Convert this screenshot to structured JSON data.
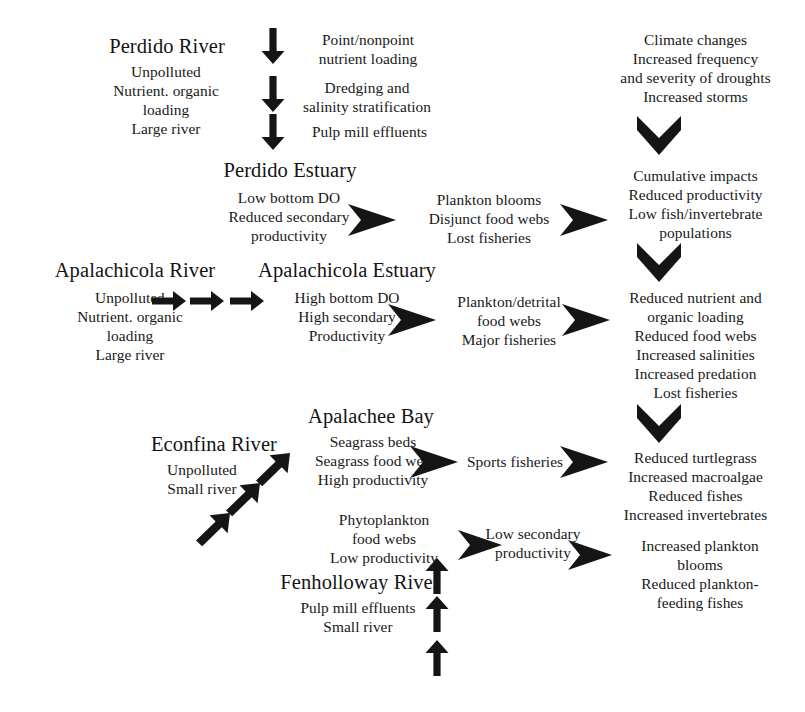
{
  "diagram": {
    "background_color": "#ffffff",
    "ink_color": "#181818",
    "nodes": {
      "perdido_river_heading": "Perdido River",
      "perdido_river_body": "Unpolluted\nNutrient. organic\nloading\nLarge river",
      "perdido_stressors_1": "Point/nonpoint\nnutrient loading",
      "perdido_stressors_2": "Dredging and\nsalinity stratification",
      "perdido_stressors_3": "Pulp mill effluents",
      "perdido_estuary_heading": "Perdido Estuary",
      "perdido_estuary_body": "Low bottom DO\nReduced secondary\nproductivity",
      "perdido_effects": "Plankton blooms\nDisjunct food webs\nLost fisheries",
      "climate": "Climate changes\nIncreased frequency\nand severity of droughts\nIncreased storms",
      "cumulative": "Cumulative impacts\nReduced productivity\nLow fish/invertebrate\npopulations",
      "apalachicola_river_heading": "Apalachicola River",
      "apalachicola_river_body": "Unpolluted\nNutrient. organic\nloading\nLarge river",
      "apalachicola_estuary_heading": "Apalachicola Estuary",
      "apalachicola_estuary_body": "High bottom DO\nHigh secondary\nProductivity",
      "apalachicola_effects": "Plankton/detrital\nfood webs\nMajor fisheries",
      "reduced_nutrient": "Reduced nutrient and\norganic loading\nReduced food webs\nIncreased salinities\nIncreased predation\nLost fisheries",
      "econfina_river_heading": "Econfina River",
      "econfina_river_body": "Unpolluted\nSmall river",
      "apalachee_bay_heading": "Apalachee Bay",
      "apalachee_bay_body": "Seagrass beds\nSeagrass food web\nHigh productivity",
      "sports_fisheries": "Sports fisheries",
      "reduced_turtlegrass": "Reduced turtlegrass\nIncreased macroalgae\nReduced fishes\nIncreased invertebrates",
      "phytoplankton": "Phytoplankton\nfood webs\nLow productivity",
      "low_secondary": "Low secondary\nproductivity",
      "increased_plankton": "Increased plankton\nblooms\nReduced plankton-\nfeeding fishes",
      "fenholloway_river_heading": "Fenholloway River",
      "fenholloway_river_body": "Pulp mill effluents\nSmall river"
    },
    "arrows": [
      {
        "name": "perdido-down-arrow-1",
        "kind": "down-arrow"
      },
      {
        "name": "perdido-down-arrow-2",
        "kind": "down-arrow"
      },
      {
        "name": "perdido-down-arrow-3",
        "kind": "down-arrow"
      },
      {
        "name": "perdido-estuary-right-chevron-1",
        "kind": "right-chevron"
      },
      {
        "name": "perdido-effects-right-chevron-2",
        "kind": "right-chevron"
      },
      {
        "name": "climate-down-chevron",
        "kind": "down-chevron"
      },
      {
        "name": "cumulative-down-chevron",
        "kind": "down-chevron"
      },
      {
        "name": "reduced-nutrient-down-chevron",
        "kind": "down-chevron"
      },
      {
        "name": "apalachicola-right-arrow-1",
        "kind": "right-arrow"
      },
      {
        "name": "apalachicola-right-arrow-2",
        "kind": "right-arrow"
      },
      {
        "name": "apalachicola-right-arrow-3",
        "kind": "right-arrow"
      },
      {
        "name": "apalachicola-estuary-right-chevron-1",
        "kind": "right-chevron"
      },
      {
        "name": "apalachicola-effects-right-chevron-2",
        "kind": "right-chevron"
      },
      {
        "name": "econfina-diagonal-arrow-1",
        "kind": "diagonal-arrow"
      },
      {
        "name": "econfina-diagonal-arrow-2",
        "kind": "diagonal-arrow"
      },
      {
        "name": "econfina-diagonal-arrow-3",
        "kind": "diagonal-arrow"
      },
      {
        "name": "apalachee-bay-right-chevron-1",
        "kind": "right-chevron"
      },
      {
        "name": "sports-fisheries-right-chevron-2",
        "kind": "right-chevron"
      },
      {
        "name": "phytoplankton-right-chevron",
        "kind": "right-chevron"
      },
      {
        "name": "low-secondary-right-chevron",
        "kind": "right-chevron"
      },
      {
        "name": "fenholloway-up-arrow-1",
        "kind": "up-arrow"
      },
      {
        "name": "fenholloway-up-arrow-2",
        "kind": "up-arrow"
      },
      {
        "name": "fenholloway-up-arrow-3",
        "kind": "up-arrow"
      }
    ]
  }
}
